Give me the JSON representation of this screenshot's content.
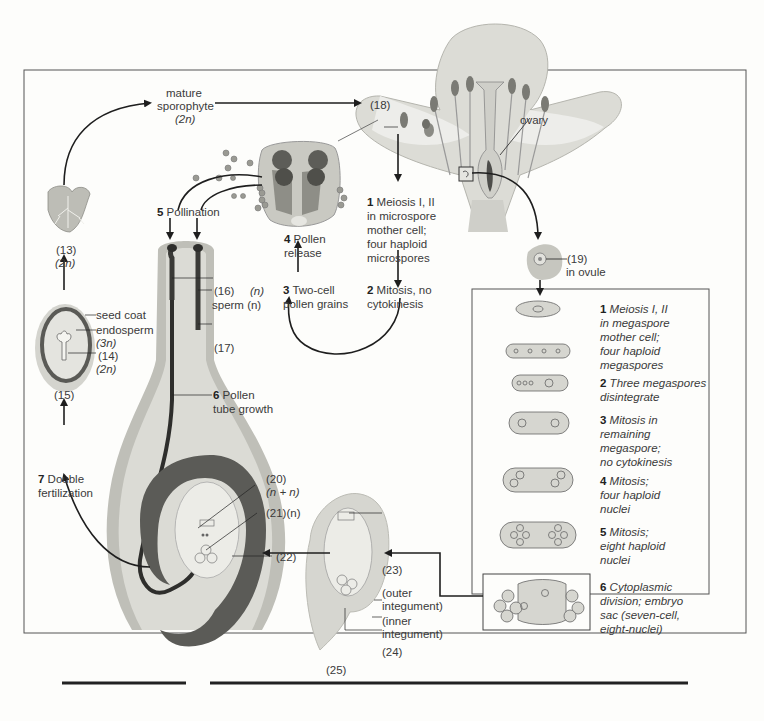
{
  "diagram": {
    "labels": {
      "mature_sporophyte": "mature",
      "mature_sporophyte_2": "sporophyte",
      "mature_sporophyte_ploidy": "(2n)",
      "ovary": "ovary",
      "l18": "(18)",
      "l19": "(19)",
      "in_ovule": "in ovule",
      "l13": "(13)",
      "l13_ploidy": "(2n)",
      "seed_coat": "seed coat",
      "endosperm": "endosperm",
      "endosperm_ploidy": "(3n)",
      "l14": "(14)",
      "l14_ploidy": "(2n)",
      "l15": "(15)",
      "l16": "(16)",
      "l16_ploidy": "(n)",
      "sperm": "sperm (n)",
      "l17": "(17)",
      "l20": "(20)",
      "l20_ploidy": "(n + n)",
      "l21": "(21)(n)",
      "l22": "(22)",
      "l23": "(23)",
      "outer_integument_1": "(outer",
      "outer_integument_2": "integument)",
      "inner_integument_1": "(inner",
      "inner_integument_2": "integument)",
      "l24": "(24)",
      "l25": "(25)"
    },
    "male_steps": [
      {
        "num": "1",
        "text": [
          "Meiosis I, II",
          "in microspore",
          "mother cell;",
          "four haploid",
          "microspores"
        ]
      },
      {
        "num": "2",
        "text": [
          "Mitosis, no",
          "cytokinesis"
        ]
      },
      {
        "num": "3",
        "text": [
          "Two-cell",
          "pollen grains"
        ]
      },
      {
        "num": "4",
        "text": [
          "Pollen",
          "release"
        ]
      },
      {
        "num": "5",
        "text": [
          "Pollination"
        ]
      },
      {
        "num": "6",
        "text": [
          "Pollen",
          "tube growth"
        ]
      },
      {
        "num": "7",
        "text": [
          "Double",
          "fertilization"
        ]
      }
    ],
    "female_steps": [
      {
        "num": "1",
        "text": [
          "Meiosis I, II",
          "in megaspore",
          "mother cell;",
          "four haploid",
          "megaspores"
        ]
      },
      {
        "num": "2",
        "text": [
          "Three megaspores",
          "disintegrate"
        ]
      },
      {
        "num": "3",
        "text": [
          "Mitosis in",
          "remaining",
          "megaspore;",
          "no cytokinesis"
        ]
      },
      {
        "num": "4",
        "text": [
          "Mitosis;",
          "four haploid",
          "nuclei"
        ]
      },
      {
        "num": "5",
        "text": [
          "Mitosis;",
          "eight haploid",
          "nuclei"
        ]
      },
      {
        "num": "6",
        "text": [
          "Cytoplasmic",
          "division; embryo",
          "sac (seven-cell,",
          "eight-nuclei)"
        ]
      }
    ],
    "colors": {
      "tissue_light": "#d9d9d3",
      "tissue_mid": "#a8a8a2",
      "tissue_dark": "#4a4a48",
      "line": "#1e1e1e",
      "frame": "#555555"
    }
  }
}
